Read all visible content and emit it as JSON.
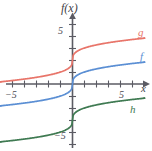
{
  "chart_data": {
    "type": "line",
    "title": "",
    "xlabel": "x",
    "ylabel": "f(x)",
    "xlim": [
      -6.2,
      6.2
    ],
    "ylim": [
      -6.6,
      6.4
    ],
    "grid": false,
    "legend_position": "inline-curve-end",
    "x_ticks": [
      -5,
      -4,
      -3,
      -2,
      -1,
      1,
      2,
      3,
      4,
      5
    ],
    "x_tick_labels_shown": [
      "-5",
      "5"
    ],
    "y_ticks": [
      -5,
      -4,
      -3,
      -2,
      -1,
      1,
      2,
      3,
      4,
      5
    ],
    "y_tick_labels_shown": [
      "5",
      "-5"
    ],
    "series": [
      {
        "name": "g",
        "label": "g",
        "color": "#e8756a",
        "description": "cube-root shaped curve shifted up 2 units",
        "x": [
          -6,
          -5,
          -4,
          -3,
          -2,
          -1,
          -0.5,
          -0.1,
          0,
          0.1,
          0.5,
          1,
          2,
          3,
          4,
          5,
          6
        ],
        "y": [
          0.18,
          0.29,
          0.41,
          0.56,
          0.74,
          1.0,
          1.21,
          1.54,
          2.0,
          2.46,
          2.79,
          3.0,
          3.26,
          3.44,
          3.59,
          3.71,
          3.82
        ]
      },
      {
        "name": "f",
        "label": "f",
        "color": "#5b8fd4",
        "description": "cube-root shaped curve through the origin",
        "x": [
          -6,
          -5,
          -4,
          -3,
          -2,
          -1,
          -0.5,
          -0.1,
          0,
          0.1,
          0.5,
          1,
          2,
          3,
          4,
          5,
          6
        ],
        "y": [
          -1.82,
          -1.71,
          -1.59,
          -1.44,
          -1.26,
          -1.0,
          -0.79,
          -0.46,
          0.0,
          0.46,
          0.79,
          1.0,
          1.26,
          1.44,
          1.59,
          1.71,
          1.82
        ]
      },
      {
        "name": "h",
        "label": "h",
        "color": "#3f7a52",
        "description": "cube-root shaped curve shifted down 3 units",
        "x": [
          -6,
          -5,
          -4,
          -3,
          -2,
          -1,
          -0.5,
          -0.1,
          0,
          0.1,
          0.5,
          1,
          2,
          3,
          4,
          5,
          6
        ],
        "y": [
          -4.82,
          -4.71,
          -4.59,
          -4.44,
          -4.26,
          -4.0,
          -3.79,
          -3.46,
          -3.0,
          -2.54,
          -2.21,
          -2.0,
          -1.74,
          -1.56,
          -1.41,
          -1.29,
          -1.18
        ]
      }
    ],
    "annotations": [
      {
        "text": "g",
        "color": "#e8756a",
        "at": "right end of red curve"
      },
      {
        "text": "f",
        "color": "#5b8fd4",
        "at": "right end of blue curve"
      },
      {
        "text": "h",
        "color": "#3f7a52",
        "at": "right end of green curve"
      }
    ]
  },
  "axes": {
    "y_axis_label": "f(x)",
    "x_axis_label": "x",
    "x_tick_neg5": "−5",
    "x_tick_pos5": "5",
    "y_tick_pos5": "5",
    "y_tick_neg5": "−5"
  },
  "colors": {
    "curve_g": "#e8756a",
    "curve_f": "#5b8fd4",
    "curve_h": "#3f7a52",
    "axis": "#5b5b63",
    "text": "#4a4a52",
    "background": "#ffffff"
  }
}
